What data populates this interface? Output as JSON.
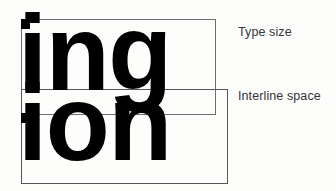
{
  "diagram": {
    "background_color": "#fdfdfc",
    "ink_color": "#000000",
    "rule_color": "#6e6e70"
  },
  "specimens": [
    {
      "id": "upper",
      "text": "ing",
      "role": "type-size-specimen"
    },
    {
      "id": "lower",
      "text": "ion",
      "role": "interline-space-specimen"
    }
  ],
  "measures": [
    {
      "id": "type-size",
      "label": "Type size",
      "rect": {
        "x": 21,
        "y": 19,
        "width": 195,
        "height": 96
      }
    },
    {
      "id": "interline-space",
      "label": "Interline space",
      "rect": {
        "x": 21,
        "y": 89,
        "width": 207,
        "height": 95
      }
    }
  ],
  "captions": {
    "type_size": "Type size",
    "interline_space": "Interline space"
  }
}
